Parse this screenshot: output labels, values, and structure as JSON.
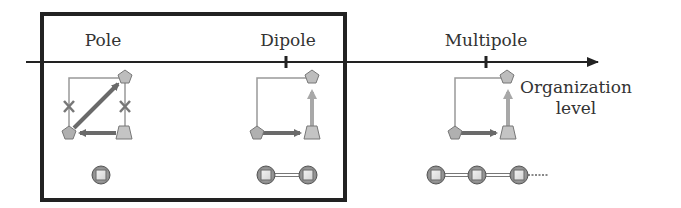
{
  "diagram": {
    "axis": {
      "label_line1": "Organization",
      "label_line2": "level"
    },
    "stages": [
      {
        "id": "pole",
        "label": "Pole"
      },
      {
        "id": "dipole",
        "label": "Dipole"
      },
      {
        "id": "multipole",
        "label": "Multipole"
      }
    ],
    "colors": {
      "frame": "#222222",
      "axis": "#222222",
      "node_fill": "#b8b8b8",
      "node_stroke": "#777777",
      "arrow_dark": "#6a6a6a",
      "arrow_light": "#a8a8a8",
      "thin_line": "#999999",
      "text": "#333333"
    }
  }
}
